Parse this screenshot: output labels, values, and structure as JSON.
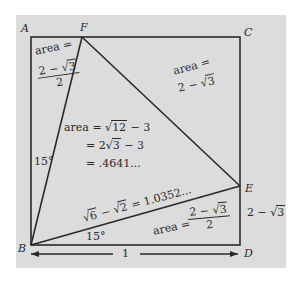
{
  "figure": {
    "background_color": "#dcdcdc",
    "line_color": "#2a2a2a",
    "vertices": {
      "A": {
        "label": "A",
        "x": 31,
        "y": 37
      },
      "F": {
        "label": "F",
        "x": 82,
        "y": 37
      },
      "C": {
        "label": "C",
        "x": 240,
        "y": 37
      },
      "E": {
        "label": "E",
        "x": 240,
        "y": 186
      },
      "D": {
        "label": "D",
        "x": 240,
        "y": 245
      },
      "B": {
        "label": "B",
        "x": 31,
        "y": 245
      }
    }
  },
  "labels": {
    "vertex_A": "A",
    "vertex_F": "F",
    "vertex_C": "C",
    "vertex_E": "E",
    "vertex_D": "D",
    "vertex_B": "B",
    "triangle_AFB": {
      "area_label": "area =",
      "numerator_prefix": "2 − ",
      "numerator_sqrt_symbol": "√",
      "numerator_radicand": "3",
      "denominator": "2"
    },
    "triangle_FCE": {
      "area_label": "area =",
      "value_prefix": "2 − ",
      "sqrt_symbol": "√",
      "radicand": "3"
    },
    "triangle_BFE": {
      "line1_prefix": "area = ",
      "line1_sqrt_symbol": "√",
      "line1_radicand": "12",
      "line1_suffix": " − 3",
      "line2_prefix": "= 2",
      "line2_sqrt_symbol": "√",
      "line2_radicand": "3",
      "line2_suffix": " − 3",
      "line3": "= .4641..."
    },
    "triangle_BDE": {
      "area_label": "area =",
      "numerator_prefix": "2 − ",
      "numerator_sqrt_symbol": "√",
      "numerator_radicand": "3",
      "denominator": "2"
    },
    "side_BE": {
      "sqrt_symbol_1": "√",
      "radicand_1": "6",
      "minus": " − ",
      "sqrt_symbol_2": "√",
      "radicand_2": "2",
      "suffix": " = 1.0352..."
    },
    "side_ED": {
      "prefix": "2 − ",
      "sqrt_symbol": "√",
      "radicand": "3"
    },
    "angle_ABF": "15°",
    "angle_EBD": "15°",
    "side_BD_length": "1"
  }
}
